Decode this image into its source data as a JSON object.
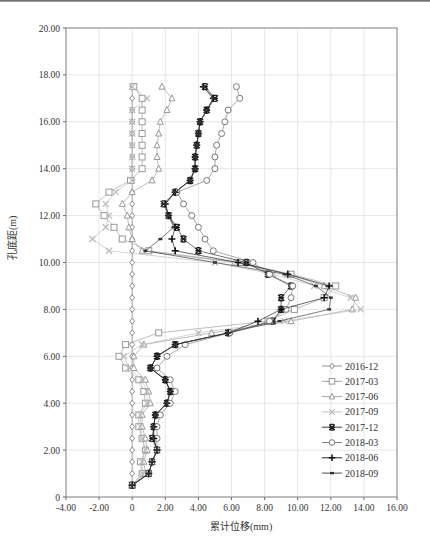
{
  "chart_data": {
    "type": "line",
    "title": "",
    "xlabel": "累计位移(mm)",
    "ylabel": "孔底距(m)",
    "xlim": [
      -4,
      16
    ],
    "ylim": [
      0,
      20
    ],
    "xticks": [
      "-4.00",
      "-2.00",
      "0",
      "2.00",
      "4.00",
      "6.00",
      "8.00",
      "10.00",
      "12.00",
      "14.00",
      "16.00"
    ],
    "yticks": [
      "0",
      "2.00",
      "4.00",
      "6.00",
      "8.00",
      "10.00",
      "12.00",
      "14.00",
      "16.00",
      "18.00",
      "20.00"
    ],
    "grid": true,
    "legend_position": "lower right inside",
    "depths": [
      0.5,
      1.0,
      1.5,
      2.0,
      2.5,
      3.0,
      3.5,
      4.0,
      4.5,
      5.0,
      5.5,
      6.0,
      6.5,
      7.0,
      7.5,
      8.0,
      8.5,
      9.0,
      9.5,
      10.0,
      10.5,
      11.0,
      11.5,
      12.0,
      12.5,
      13.0,
      13.5,
      14.0,
      14.5,
      15.0,
      15.5,
      16.0,
      16.5,
      17.0,
      17.5
    ],
    "series": [
      {
        "name": "2016-12",
        "marker": "diamond",
        "color": "#888888",
        "values": [
          0,
          0,
          0,
          0,
          0,
          0,
          0,
          0,
          0,
          0,
          0,
          0,
          0,
          0,
          0,
          0,
          0,
          0,
          0,
          0,
          0,
          0,
          0,
          0,
          0,
          0,
          0,
          0,
          0,
          0,
          0,
          0,
          0,
          0,
          0
        ]
      },
      {
        "name": "2017-03",
        "marker": "square",
        "color": "#999999",
        "values": [
          0,
          0.6,
          0.5,
          0.8,
          0.6,
          0.4,
          0.4,
          0.8,
          0.7,
          0.4,
          -0.4,
          -0.8,
          -0.4,
          1.6,
          8.2,
          9.8,
          11.6,
          12.3,
          9.6,
          6.5,
          1.0,
          -0.6,
          -1.1,
          -1.7,
          -2.2,
          -1.4,
          -0.1,
          0.6,
          0.6,
          0.6,
          0.6,
          0.6,
          0.6,
          0.6,
          0.1
        ]
      },
      {
        "name": "2017-06",
        "marker": "triangle",
        "color": "#999999",
        "values": [
          0,
          0.8,
          0.7,
          0.9,
          0.8,
          0.6,
          0.6,
          1.1,
          1.0,
          0.8,
          0.1,
          0.1,
          0.7,
          4.8,
          9.6,
          13.3,
          13.5,
          11.6,
          9.4,
          6.2,
          0.6,
          0.0,
          -0.2,
          -0.3,
          -0.6,
          0.0,
          1.2,
          1.6,
          1.5,
          1.5,
          1.6,
          1.7,
          2.1,
          2.4,
          1.8
        ]
      },
      {
        "name": "2017-09",
        "marker": "x",
        "color": "#bbbbbb",
        "values": [
          0,
          0.6,
          0.6,
          0.8,
          0.6,
          0.5,
          0.5,
          0.9,
          0.9,
          0.6,
          -0.2,
          -0.5,
          0.6,
          4.0,
          9.2,
          13.8,
          13.2,
          11.0,
          8.5,
          5.0,
          -1.4,
          -2.4,
          -1.6,
          -1.4,
          -1.6,
          -1.0,
          0.0,
          0.0,
          0.0,
          0.0,
          0.0,
          0.0,
          0.0,
          0.9,
          0.0
        ]
      },
      {
        "name": "2017-12",
        "marker": "asterisk",
        "color": "#222222",
        "values": [
          0,
          1.0,
          1.2,
          1.5,
          1.2,
          1.3,
          1.4,
          2.1,
          2.3,
          2.0,
          1.1,
          1.5,
          2.6,
          5.8,
          8.5,
          9.0,
          9.0,
          9.6,
          8.2,
          6.9,
          4.0,
          3.1,
          2.7,
          2.2,
          1.9,
          2.6,
          3.5,
          3.8,
          3.8,
          3.9,
          4.0,
          4.1,
          4.5,
          5.0,
          4.4
        ]
      },
      {
        "name": "2018-03",
        "marker": "circle",
        "color": "#777777",
        "values": [
          0,
          1.0,
          1.2,
          1.5,
          1.5,
          1.5,
          1.7,
          2.3,
          2.6,
          2.3,
          1.5,
          2.1,
          3.2,
          5.9,
          8.3,
          9.3,
          9.6,
          9.7,
          8.3,
          7.3,
          4.9,
          4.4,
          4.0,
          3.6,
          3.1,
          2.7,
          4.5,
          5.0,
          5.0,
          5.1,
          5.4,
          5.6,
          5.8,
          6.5,
          6.3
        ]
      },
      {
        "name": "2018-06",
        "marker": "plus",
        "color": "#111111",
        "values": [
          0,
          1.0,
          1.2,
          1.5,
          1.3,
          1.3,
          1.4,
          2.1,
          2.3,
          2.0,
          1.1,
          1.5,
          2.6,
          5.8,
          7.6,
          9.0,
          11.6,
          11.9,
          9.4,
          6.4,
          2.6,
          2.4,
          2.6,
          2.2,
          2.0,
          2.6,
          3.5,
          3.8,
          3.8,
          3.9,
          4.0,
          4.1,
          4.5,
          4.9,
          4.3
        ]
      },
      {
        "name": "2018-09",
        "marker": "dash",
        "color": "#333333",
        "values": [
          0,
          1.0,
          1.2,
          1.5,
          1.3,
          1.3,
          1.4,
          2.1,
          2.3,
          2.0,
          1.1,
          1.5,
          2.6,
          5.8,
          8.9,
          11.9,
          12.0,
          11.1,
          9.2,
          5.0,
          0.8,
          1.7,
          2.5,
          2.2,
          2.0,
          2.6,
          3.5,
          3.8,
          3.8,
          3.9,
          4.0,
          4.1,
          4.5,
          4.9,
          4.3
        ]
      }
    ]
  }
}
